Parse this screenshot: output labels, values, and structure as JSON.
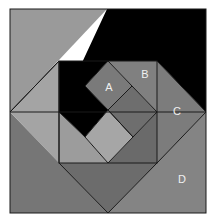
{
  "diagram": {
    "type": "nested-squares-geometric-figure",
    "labels": {
      "A": "A",
      "B": "B",
      "C": "C",
      "D": "D"
    },
    "colors": {
      "background": "#ffffff",
      "outer_top_left": "#9a9a9a",
      "outer_bottom": "#767676",
      "black_region": "#000000",
      "diamond_left_triangle": "#a4a4a4",
      "region_C": "#7c7c7c",
      "region_D": "#848484",
      "square_A": "#7a7a7a",
      "square_B_region": "#808080",
      "dark_square": "#6e6e6e",
      "light_square": "#a6a6a6",
      "inner_lower_left": "#9c9c9c",
      "inner_lower_right": "#6a6a6a",
      "bottom_triangle": "#6c6c6c",
      "lines": "#1a1a1a"
    }
  }
}
